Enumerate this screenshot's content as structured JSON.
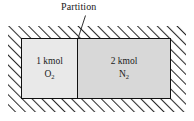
{
  "figure": {
    "callout": {
      "label": "Partition",
      "leader_from": {
        "x": 85,
        "y": 16
      },
      "leader_to": {
        "x": 78,
        "y": 38
      }
    },
    "wall": {
      "style": "diagonal-hatching",
      "hatch_color": "#2b2b2b",
      "fill_color": "#ffffff"
    },
    "container": {
      "border_color": "#111111",
      "partition_color": "#111111"
    },
    "chambers": [
      {
        "id": "left",
        "amount": "1 kmol",
        "species_symbol": "O",
        "species_subscript": "2",
        "fill_color": "#e9e9e9"
      },
      {
        "id": "right",
        "amount": "2 kmol",
        "species_symbol": "N",
        "species_subscript": "2",
        "fill_color": "#d8d8d8"
      }
    ]
  }
}
